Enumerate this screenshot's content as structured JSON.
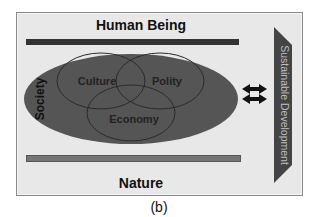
{
  "diagram": {
    "top_label": "Human Being",
    "bottom_label": "Nature",
    "society_label": "Society",
    "circles": [
      {
        "label": "Culture"
      },
      {
        "label": "Polity"
      },
      {
        "label": "Economy"
      }
    ],
    "side_arrow_label": "Sustainable Development",
    "connector_icon": "double-arrow-icon",
    "caption": "(b)"
  },
  "colors": {
    "background": "#e8e8e8",
    "top_bar": "#333333",
    "bottom_bar": "#757575",
    "ellipse": "#555555",
    "side_arrow": "#444444",
    "side_text": "#bdbdbd"
  }
}
